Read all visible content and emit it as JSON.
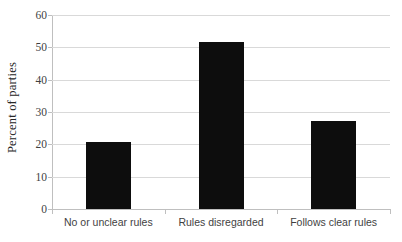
{
  "chart_data": {
    "type": "bar",
    "title": "",
    "subtitle": "",
    "xlabel": "",
    "ylabel": "Percent of parties",
    "categories": [
      "No or unclear rules",
      "Rules disregarded",
      "Follows clear rules"
    ],
    "values": [
      20.8,
      51.6,
      27.3
    ],
    "series": [
      {
        "name": "Percent of parties",
        "values": [
          20.8,
          51.6,
          27.3
        ]
      }
    ],
    "ylim": [
      0,
      60
    ],
    "ytick_labels": [
      "0",
      "10",
      "20",
      "30",
      "40",
      "50",
      "60"
    ],
    "ytick_values": [
      0,
      10,
      20,
      30,
      40,
      50,
      60
    ],
    "grid": "horizontal",
    "legend": "none",
    "bar_color": "#0d0d0d",
    "gridline_color": "#d9d9d9",
    "axis_color": "#bfbfbf",
    "background": "#ffffff"
  }
}
